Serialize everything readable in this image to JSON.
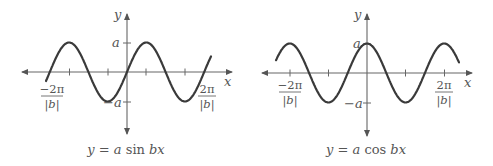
{
  "colors": {
    "curve": "#3a3a3a",
    "axis": "#555555",
    "text": "#555555",
    "background": "#ffffff"
  },
  "graphs": [
    {
      "id": "sine",
      "caption": "y = a sin bx",
      "caption_parts": [
        "y",
        " = ",
        "a",
        " sin ",
        "bx"
      ],
      "axis_labels": {
        "x": "x",
        "y": "y"
      },
      "y_ticks": {
        "pos": "a",
        "neg": "−a"
      },
      "x_ticks": {
        "neg_num": "−2π",
        "pos_num": "2π",
        "den": "|b|"
      }
    },
    {
      "id": "cosine",
      "caption": "y = a cos bx",
      "caption_parts": [
        "y",
        " = ",
        "a",
        " cos ",
        "bx"
      ],
      "axis_labels": {
        "x": "x",
        "y": "y"
      },
      "y_ticks": {
        "pos": "a",
        "neg": "−a"
      },
      "x_ticks": {
        "neg_num": "−2π",
        "pos_num": "2π",
        "den": "|b|"
      }
    }
  ]
}
